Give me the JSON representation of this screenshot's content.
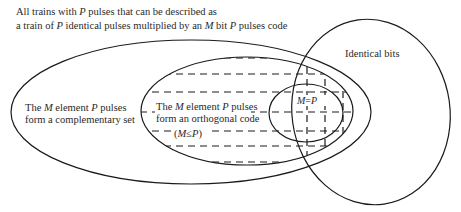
{
  "diagram": {
    "title_line1": {
      "parts": [
        "All trains with ",
        "P",
        " pulses that can be described as"
      ]
    },
    "title_line2": {
      "parts": [
        "a train of ",
        "P",
        " identical pulses multiplied by an ",
        "M",
        " bit ",
        "P",
        " pulses code"
      ]
    },
    "identical_bits_label": "Identical bits",
    "complementary_set": {
      "line1": [
        "The ",
        "M",
        " element ",
        "P",
        " pulses"
      ],
      "line2": "form a complementary set"
    },
    "orthogonal_code": {
      "line1": [
        "The ",
        "M",
        " element ",
        "P",
        " pulses"
      ],
      "line2": "form an orthogonal code",
      "line3": [
        "(",
        "M",
        "≤",
        "P",
        ")"
      ]
    },
    "equal_label": [
      "M",
      "=",
      "P"
    ],
    "colors": {
      "stroke": "#1a1a1a",
      "text": "#2a2a2a",
      "background": "#ffffff"
    }
  }
}
